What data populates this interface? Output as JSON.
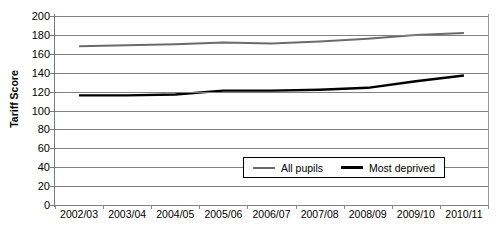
{
  "chart_data": {
    "type": "line",
    "title": "",
    "xlabel": "",
    "ylabel": "Tariff Score",
    "ylim": [
      0,
      200
    ],
    "ytick_step": 20,
    "yticks": [
      200,
      180,
      160,
      140,
      120,
      100,
      80,
      60,
      40,
      20,
      0
    ],
    "grid": true,
    "legend_position": "inside-bottom-center",
    "categories": [
      "2002/03",
      "2003/04",
      "2004/05",
      "2005/06",
      "2006/07",
      "2007/08",
      "2008/09",
      "2009/10",
      "2010/11"
    ],
    "series": [
      {
        "name": "All pupils",
        "color": "#6b6b6b",
        "width": 2.0,
        "values": [
          168,
          169,
          170,
          172,
          171,
          173,
          176,
          180,
          182
        ]
      },
      {
        "name": "Most deprived",
        "color": "#000000",
        "width": 2.4,
        "values": [
          116,
          116,
          117,
          121,
          121,
          122,
          124,
          131,
          137
        ]
      }
    ]
  },
  "axes": {
    "y_title": "Tariff Score",
    "gridline_color": "#808080",
    "axis_color": "#7a7a7a"
  },
  "legend": {
    "items": [
      {
        "label": "All pupils",
        "color": "#6b6b6b",
        "width": 2
      },
      {
        "label": "Most deprived",
        "color": "#000000",
        "width": 3
      }
    ]
  }
}
